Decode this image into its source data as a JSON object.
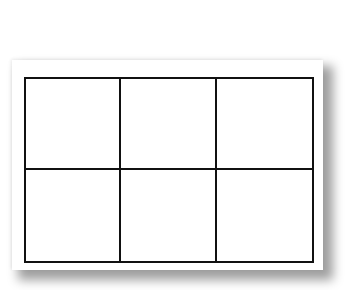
{
  "diagram": {
    "type": "grid",
    "rows": 2,
    "columns": 3,
    "cells": [
      {
        "row": 0,
        "col": 0,
        "label": ""
      },
      {
        "row": 0,
        "col": 1,
        "label": ""
      },
      {
        "row": 0,
        "col": 2,
        "label": ""
      },
      {
        "row": 1,
        "col": 0,
        "label": ""
      },
      {
        "row": 1,
        "col": 1,
        "label": ""
      },
      {
        "row": 1,
        "col": 2,
        "label": ""
      }
    ],
    "line_color": "#111111",
    "paper_color": "#ffffff"
  }
}
